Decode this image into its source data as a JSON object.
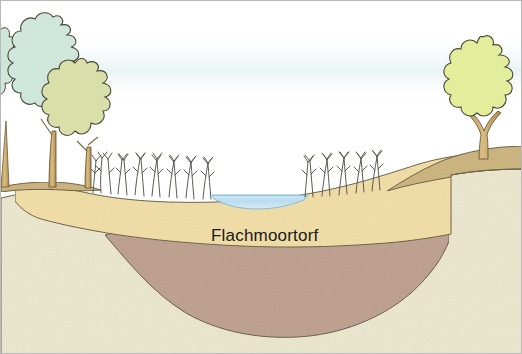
{
  "figure": {
    "type": "geological-cross-section",
    "title_visible": false,
    "labels": {
      "peat_layer": "Flachmoortorf"
    },
    "frame": {
      "width": 522,
      "height": 354,
      "border_color": "#b9b9b9",
      "background": "#ffffff"
    }
  },
  "colors": {
    "sky": "#ffffff",
    "haze": "#eaf2f4",
    "water": "#bfe0ef",
    "water_edge": "#8fc7dd",
    "topsoil_tan": "#cdb680",
    "peat_yellow": "#f2dfa8",
    "peat_brown": "#c0a392",
    "base_cream": "#ece8d0",
    "outline": "#4a4637",
    "tree_blue_green": "#cfe6da",
    "tree_olive": "#d9dfa8",
    "tree_lime": "#e3ee9c",
    "trunk": "#c8a86c",
    "trunk_outline": "#6b5a3a",
    "reed": "#5a5a56",
    "text": "#1a1a1a"
  },
  "scene": {
    "trees": [
      {
        "name": "tree-left-edge",
        "crown_fill": "#cfe6da",
        "x": 6,
        "y": 70,
        "partial": true
      },
      {
        "name": "tree-left-tall",
        "crown_fill": "#cfe6da",
        "x": 45,
        "y": 80
      },
      {
        "name": "tree-left-short",
        "crown_fill": "#d9dfa8",
        "x": 72,
        "y": 112
      },
      {
        "name": "tree-right",
        "crown_fill": "#e3ee9c",
        "x": 482,
        "y": 85,
        "forked_trunk": true
      }
    ],
    "reed_clumps": [
      {
        "name": "reed-clump-left",
        "count": 15,
        "x_start": 88,
        "x_end": 214,
        "base_y": 192,
        "height": 36
      },
      {
        "name": "reed-clump-right",
        "count": 10,
        "x_start": 300,
        "x_end": 378,
        "base_y": 190,
        "height": 34
      }
    ],
    "water_body": {
      "name": "open-water-pond",
      "x_left": 212,
      "x_right": 305,
      "surface_y": 195,
      "fill": "#bfe0ef"
    },
    "strata": [
      {
        "name": "topsoil-tan-layer",
        "label": "",
        "fill": "#cdb680",
        "order": 1
      },
      {
        "name": "peat-yellow-layer",
        "label": "Flachmoortorf",
        "fill": "#f2dfa8",
        "order": 2
      },
      {
        "name": "peat-brown-layer",
        "label": "",
        "fill": "#c0a392",
        "order": 3
      },
      {
        "name": "base-cream-layer",
        "label": "",
        "fill": "#ece8d0",
        "order": 4
      }
    ]
  }
}
